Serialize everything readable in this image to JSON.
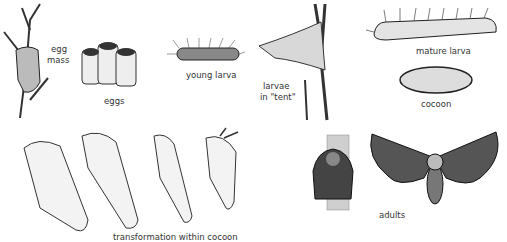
{
  "figure": {
    "stages": [
      {
        "id": "egg-mass",
        "label_lines": [
          "egg",
          "mass"
        ]
      },
      {
        "id": "eggs",
        "label": "eggs"
      },
      {
        "id": "young-larva",
        "label": "young larva"
      },
      {
        "id": "larvae-tent",
        "label_lines": [
          "larvae",
          "in \"tent\""
        ]
      },
      {
        "id": "mature-larva",
        "label": "mature larva"
      },
      {
        "id": "cocoon",
        "label": "cocoon"
      },
      {
        "id": "transformation",
        "label": "transformation within cocoon"
      },
      {
        "id": "adults",
        "label": "adults"
      }
    ]
  }
}
